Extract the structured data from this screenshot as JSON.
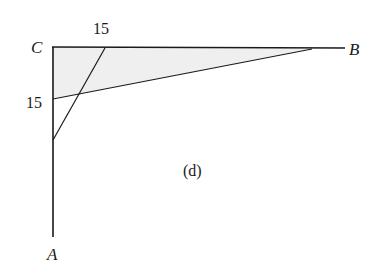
{
  "figure": {
    "caption": "(d)",
    "background_color": "#ffffff",
    "stroke_color": "#1a1a1a",
    "shade_color": "#efefef"
  },
  "vertices": [
    {
      "name": "A",
      "label": "A",
      "label_x": 53,
      "label_y": 255,
      "point_x": 53,
      "point_y": 237
    },
    {
      "name": "B",
      "label": "B",
      "label_x": 355,
      "label_y": 50,
      "point_x": 312,
      "point_y": 49
    },
    {
      "name": "C",
      "label": "C",
      "label_x": 38,
      "label_y": 48,
      "point_x": 52,
      "point_y": 47
    }
  ],
  "measures": [
    {
      "id": "top-segment",
      "value": "15",
      "label_x": 103,
      "label_y": 30,
      "segment_from": "C",
      "segment_to": "Q"
    },
    {
      "id": "left-segment",
      "value": "15",
      "label_x": 37,
      "label_y": 104,
      "segment_from": "C",
      "segment_to": "P"
    }
  ],
  "geometry": {
    "leg_vertical": {
      "x1": 53,
      "y1": 47,
      "x2": 53,
      "y2": 237
    },
    "leg_horizontal": {
      "x1": 52,
      "y1": 47,
      "x2": 345,
      "y2": 48
    },
    "cevian_p_to_b": {
      "x1": 53,
      "y1": 99,
      "x2": 312,
      "y2": 49
    },
    "cevian_q_to_ac": {
      "x1": 105,
      "y1": 48,
      "x2": 53,
      "y2": 140
    },
    "shaded_region": "52,47 312,49 53,99",
    "point_p": {
      "x": 53,
      "y": 99
    },
    "point_q": {
      "x": 105,
      "y": 48
    },
    "point_r": {
      "x": 53,
      "y": 140
    }
  }
}
